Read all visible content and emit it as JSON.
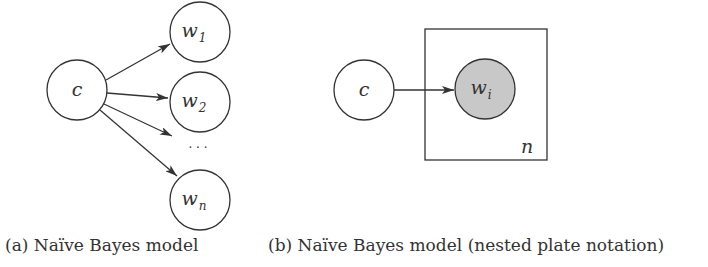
{
  "figure_a": {
    "caption": "(a) Naïve Bayes model",
    "class_node": {
      "label": "c"
    },
    "word_nodes": [
      {
        "base": "w",
        "sub": "1"
      },
      {
        "base": "w",
        "sub": "2"
      },
      {
        "base": "w",
        "sub": "n"
      }
    ],
    "ellipsis": "· · ·"
  },
  "figure_b": {
    "caption": "(b) Naïve Bayes model (nested plate notation)",
    "class_node": {
      "label": "c"
    },
    "observed_node": {
      "base": "w",
      "sub": "i",
      "fill": "#c8c8c8"
    },
    "plate_label": "n"
  },
  "colors": {
    "stroke": "#333333",
    "observed_fill": "#c8c8c8",
    "background": "#ffffff"
  }
}
